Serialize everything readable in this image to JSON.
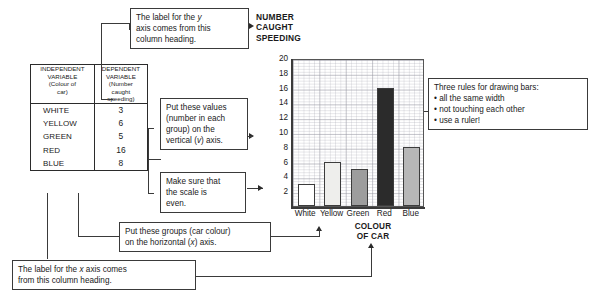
{
  "table": {
    "headers": [
      "INDEPENDENT VARIABLE (Colour of car)",
      "DEPENDENT VARIABLE (Number caught speeding)"
    ],
    "header_lines": {
      "left": [
        "INDEPENDENT",
        "VARIABLE",
        "(Colour of",
        "car)"
      ],
      "right": [
        "DEPENDENT",
        "VARIABLE",
        "(Number",
        "caught",
        "speeding)"
      ]
    },
    "rows": [
      {
        "label": "WHITE",
        "value": "3"
      },
      {
        "label": "YELLOW",
        "value": "6"
      },
      {
        "label": "GREEN",
        "value": "5"
      },
      {
        "label": "RED",
        "value": "16"
      },
      {
        "label": "BLUE",
        "value": "8"
      }
    ]
  },
  "callouts": {
    "y_axis": {
      "line1": "The label for the y",
      "line2": "axis comes from this",
      "line3": "column heading."
    },
    "values": {
      "line1": "Put these values",
      "line2": "(number in each",
      "line3": "group) on the",
      "line4": "vertical (v) axis."
    },
    "scale": {
      "line1": "Make sure that",
      "line2": "the scale is",
      "line3": "even."
    },
    "rules": {
      "title": "Three rules for drawing bars:",
      "items": [
        "• all the same width",
        "• not touching each other",
        "• use a ruler!"
      ]
    },
    "groups": {
      "line1": "Put these groups (car colour)",
      "line2": "on the horizontal (x) axis."
    },
    "x_axis": {
      "line1": "The label for the x axis comes",
      "line2": "from this column heading."
    }
  },
  "chart_data": {
    "type": "bar",
    "title": "NUMBER CAUGHT SPEEDING",
    "title_lines": [
      "NUMBER",
      "CAUGHT",
      "SPEEDING"
    ],
    "categories": [
      "White",
      "Yellow",
      "Green",
      "Red",
      "Blue"
    ],
    "values": [
      3,
      6,
      5,
      16,
      8
    ],
    "xlabel": "COLOUR OF CAR",
    "xlabel_lines": [
      "COLOUR",
      "OF CAR"
    ],
    "ylabel": "NUMBER CAUGHT SPEEDING",
    "ylim": [
      0,
      20
    ],
    "ytick_labels": [
      "20",
      "18",
      "16",
      "14",
      "12",
      "10",
      "8",
      "6",
      "4",
      "2"
    ],
    "ytick_values": [
      20,
      18,
      16,
      14,
      12,
      10,
      8,
      6,
      4,
      2
    ],
    "grid": true,
    "legend": "none",
    "bar_colors": [
      "#ffffff",
      "#eeeeec",
      "#9d9d9d",
      "#2b2b2b",
      "#b7b7b7"
    ],
    "bar_outline": "#3c3c3c"
  }
}
